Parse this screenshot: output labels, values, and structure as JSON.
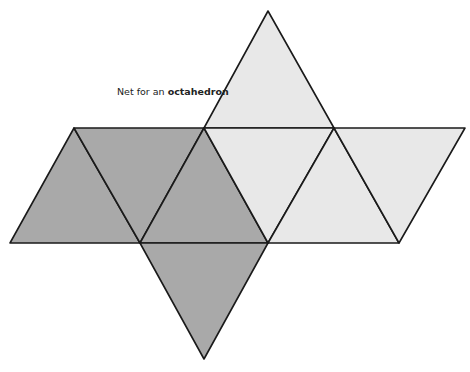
{
  "caption": {
    "prefix": "Net for an ",
    "emphasis": "octahedron"
  },
  "colors": {
    "dark_face": "#a9a9a9",
    "light_face": "#e8e8e8",
    "edge": "#1a1a1a",
    "background": "#ffffff"
  },
  "faces": [
    {
      "id": "face-1",
      "shade": "dark",
      "points": "74,128 10,243 140,243"
    },
    {
      "id": "face-2",
      "shade": "dark",
      "points": "74,128 204,128 140,243"
    },
    {
      "id": "face-3",
      "shade": "dark",
      "points": "204,128 140,243 268,243"
    },
    {
      "id": "face-4",
      "shade": "dark",
      "points": "140,243 268,243 204,359"
    },
    {
      "id": "face-5",
      "shade": "light",
      "points": "268,11 204,128 334,128"
    },
    {
      "id": "face-6",
      "shade": "light",
      "points": "204,128 334,128 268,243"
    },
    {
      "id": "face-7",
      "shade": "light",
      "points": "334,128 268,243 399,243"
    },
    {
      "id": "face-8",
      "shade": "light",
      "points": "334,128 465,128 399,243"
    }
  ]
}
